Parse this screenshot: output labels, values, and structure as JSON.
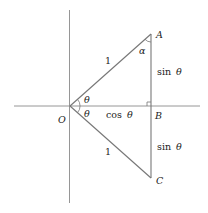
{
  "diagram": {
    "points": {
      "O": {
        "label": "O",
        "x": 70,
        "y": 106
      },
      "A": {
        "label": "A",
        "x": 151,
        "y": 34
      },
      "B": {
        "label": "B",
        "x": 151,
        "y": 106
      },
      "C": {
        "label": "C",
        "x": 151,
        "y": 178
      }
    },
    "labels": {
      "hyp_top": "1",
      "hyp_bottom": "1",
      "alpha": "α",
      "theta_top": "θ",
      "theta_bottom": "θ",
      "sin_top_fn": "sin",
      "sin_top_var": "θ",
      "sin_bottom_fn": "sin",
      "sin_bottom_var": "θ",
      "cos_fn": "cos",
      "cos_var": "θ"
    },
    "colors": {
      "axis": "#888888",
      "line": "#777777",
      "text": "#222222"
    }
  }
}
